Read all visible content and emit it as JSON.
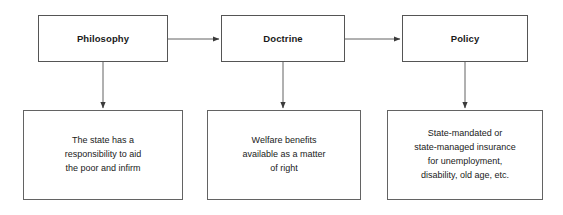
{
  "diagram": {
    "stroke_color": "#636363",
    "text_color": "#1a1a1a",
    "background_color": "#ffffff",
    "nodes": {
      "philosophy": {
        "label": "Philosophy",
        "description": "The state has a\nresponsibility to aid\nthe poor and infirm"
      },
      "doctrine": {
        "label": "Doctrine",
        "description": "Welfare benefits\navailable as a matter\nof right"
      },
      "policy": {
        "label": "Policy",
        "description": "State-mandated or\nstate-managed insurance\nfor unemployment,\ndisability, old age, etc."
      }
    },
    "connectors": [
      {
        "name": "philosophy-to-doctrine",
        "direction": "right"
      },
      {
        "name": "doctrine-to-policy",
        "direction": "right"
      },
      {
        "name": "philosophy-to-description",
        "direction": "down"
      },
      {
        "name": "doctrine-to-description",
        "direction": "down"
      },
      {
        "name": "policy-to-description",
        "direction": "down"
      }
    ]
  }
}
